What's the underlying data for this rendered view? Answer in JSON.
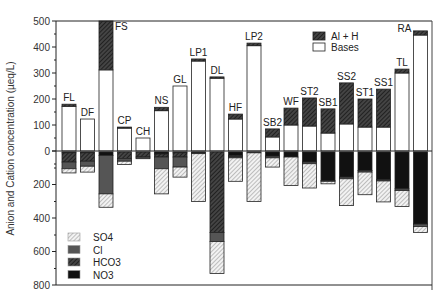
{
  "chart_data": {
    "type": "bar",
    "subtype": "diverging-stacked-bar",
    "title": "",
    "xlabel": "",
    "ylabel": "Anion and Cation concentration (µeq/L)",
    "grid": false,
    "y_ticks_positive": [
      0,
      100,
      200,
      300,
      400,
      500
    ],
    "y_ticks_negative_labels": [
      0,
      200,
      400,
      600,
      800
    ],
    "ylim": [
      -800,
      500
    ],
    "categories": [
      "FL",
      "DF",
      "FS",
      "CP",
      "CH",
      "NS",
      "GL",
      "LP1",
      "DL",
      "HF",
      "LP2",
      "SB2",
      "WF",
      "ST2",
      "SB1",
      "SS2",
      "ST1",
      "SS1",
      "TL",
      "RA"
    ],
    "cation_series": [
      {
        "name": "Bases",
        "fill": "#ffffff",
        "values": [
          172,
          123,
          312,
          88,
          50,
          155,
          250,
          346,
          280,
          123,
          405,
          54,
          100,
          96,
          69,
          104,
          92,
          92,
          300,
          446
        ]
      },
      {
        "name": "Al + H",
        "fill": "hatch-dark",
        "values": [
          8,
          0,
          188,
          4,
          0,
          13,
          0,
          8,
          5,
          19,
          10,
          31,
          65,
          108,
          93,
          158,
          108,
          146,
          15,
          16
        ]
      }
    ],
    "anion_series": [
      {
        "name": "NO3",
        "fill": "#111111",
        "values": [
          5,
          5,
          20,
          0,
          0,
          12,
          5,
          5,
          0,
          20,
          5,
          25,
          30,
          60,
          170,
          150,
          110,
          165,
          220,
          430
        ]
      },
      {
        "name": "HCO3",
        "fill": "hatch-dark",
        "values": [
          55,
          50,
          0,
          40,
          30,
          18,
          25,
          0,
          480,
          8,
          0,
          0,
          0,
          0,
          0,
          0,
          0,
          0,
          0,
          0
        ]
      },
      {
        "name": "Cl",
        "fill": "#555555",
        "values": [
          40,
          30,
          230,
          15,
          10,
          70,
          60,
          5,
          55,
          7,
          0,
          10,
          0,
          10,
          5,
          10,
          10,
          8,
          10,
          15
        ]
      },
      {
        "name": "SO4",
        "fill": "hatch-light",
        "values": [
          25,
          35,
          80,
          20,
          0,
          150,
          60,
          285,
          190,
          140,
          290,
          55,
          170,
          145,
          15,
          160,
          135,
          125,
          95,
          35
        ]
      }
    ],
    "legend_cations": {
      "position": "upper-right",
      "entries": [
        "Al + H",
        "Bases"
      ]
    },
    "legend_anions": {
      "position": "lower-left",
      "entries": [
        "SO4",
        "Cl",
        "HCO3",
        "NO3"
      ]
    }
  }
}
